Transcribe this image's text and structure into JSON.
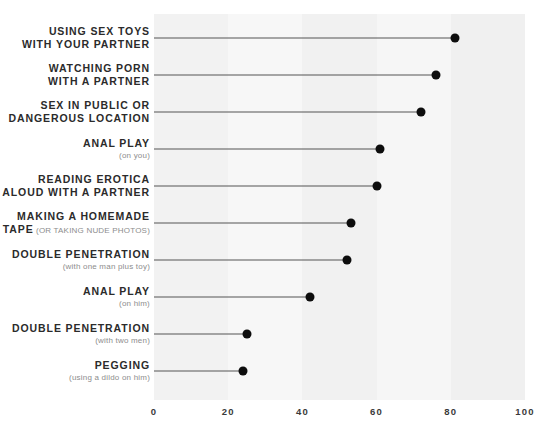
{
  "chart_data": {
    "type": "bar",
    "subtype": "lollipop-horizontal",
    "title": "",
    "subtitle": "",
    "xlabel": "",
    "ylabel": "",
    "xlim": [
      0,
      100
    ],
    "xticks": [
      "0",
      "20",
      "40",
      "60",
      "80",
      "100"
    ],
    "xtick_values": [
      0,
      20,
      40,
      60,
      80,
      100
    ],
    "grid": false,
    "legend": null,
    "banded_background": true,
    "categories": [
      "Using Sex Toys With Your Partner",
      "Watching Porn With a Partner",
      "Sex In Public or Dangerous Location",
      "Anal Play",
      "Reading Erotica Aloud With a Partner",
      "Making a Homemade Sex Tape",
      "Double Penetration",
      "Anal Play",
      "Double Penetration",
      "Pegging"
    ],
    "values": [
      81,
      76,
      72,
      61,
      60,
      53,
      52,
      42,
      25,
      24
    ],
    "rows": [
      {
        "line1": "Using Sex Toys",
        "line2": "With Your Partner",
        "sub": "",
        "sub_inline": false,
        "value": 81
      },
      {
        "line1": "Watching Porn",
        "line2": "With a Partner",
        "sub": "",
        "sub_inline": false,
        "value": 76
      },
      {
        "line1": "Sex In Public or",
        "line2": "Dangerous Location",
        "sub": "",
        "sub_inline": false,
        "value": 72
      },
      {
        "line1": "Anal Play",
        "line2": "",
        "sub": "(on you)",
        "sub_inline": false,
        "value": 61
      },
      {
        "line1": "Reading Erotica",
        "line2": "Aloud With a Partner",
        "sub": "",
        "sub_inline": false,
        "value": 60
      },
      {
        "line1": "Making a Homemade",
        "line2": "Sex Tape",
        "sub": "(or taking nude photos)",
        "sub_inline": true,
        "value": 53
      },
      {
        "line1": "Double Penetration",
        "line2": "",
        "sub": "(with one man plus toy)",
        "sub_inline": false,
        "value": 52
      },
      {
        "line1": "Anal Play",
        "line2": "",
        "sub": "(on him)",
        "sub_inline": false,
        "value": 42
      },
      {
        "line1": "Double Penetration",
        "line2": "",
        "sub": "(with two men)",
        "sub_inline": false,
        "value": 25
      },
      {
        "line1": "Pegging",
        "line2": "",
        "sub": "(using a dildo on him)",
        "sub_inline": false,
        "value": 24
      }
    ],
    "colors": {
      "dot": "#0d0d0d",
      "stem": "#555555",
      "label": "#2b2b2b",
      "sublabel": "#8d8d8d",
      "band_light": "#f7f7f7",
      "band_dark": "#f0f0f0",
      "background": "#ffffff"
    }
  }
}
